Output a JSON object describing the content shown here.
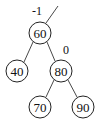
{
  "diagram": {
    "type": "binary-search-tree",
    "nodes": [
      {
        "id": "n60",
        "value": "60",
        "cx": 40,
        "cy": 33
      },
      {
        "id": "n40",
        "value": "40",
        "cx": 17,
        "cy": 71
      },
      {
        "id": "n80",
        "value": "80",
        "cx": 61,
        "cy": 71
      },
      {
        "id": "n70",
        "value": "70",
        "cx": 40,
        "cy": 107
      },
      {
        "id": "n90",
        "value": "90",
        "cx": 83,
        "cy": 107
      }
    ],
    "edges": [
      {
        "from": "n60",
        "to": "n40"
      },
      {
        "from": "n60",
        "to": "n80"
      },
      {
        "from": "n80",
        "to": "n70"
      },
      {
        "from": "n80",
        "to": "n90"
      }
    ],
    "parent_link": {
      "from": "n60",
      "x2": 58,
      "y2": 6
    },
    "annotations": [
      {
        "text": "-1",
        "x": 37,
        "y": 11,
        "attached_to": "n60-parent-link"
      },
      {
        "text": "0",
        "x": 66,
        "y": 50,
        "attached_to": "n80"
      }
    ],
    "node_radius": 11
  }
}
